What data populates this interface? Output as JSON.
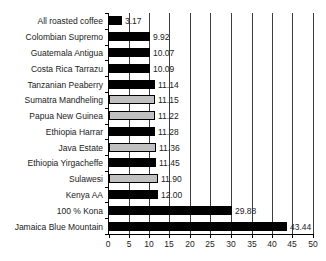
{
  "chart_data": {
    "type": "bar",
    "orientation": "horizontal",
    "title": "",
    "xlabel": "",
    "ylabel": "",
    "legend": "none",
    "grid": "vertical gridlines at each x tick",
    "categories": [
      "All roasted coffee",
      "Colombian Supremo",
      "Guatemala Antigua",
      "Costa Rica Tarrazu",
      "Tanzanian Peaberry",
      "Sumatra Mandheling",
      "Papua New Guinea",
      "Ethiopia Harrar",
      "Java Estate",
      "Ethiopia Yirgacheffe",
      "Sulawesi",
      "Kenya AA",
      "100 % Kona",
      "Jamaica Blue Mountain"
    ],
    "values": [
      3.17,
      9.92,
      10.07,
      10.09,
      11.14,
      11.15,
      11.22,
      11.28,
      11.36,
      11.45,
      11.9,
      12.0,
      29.88,
      43.44
    ],
    "value_labels": [
      "3.17",
      "9.92",
      "10.07",
      "10.09",
      "11.14",
      "11.15",
      "11.22",
      "11.28",
      "11.36",
      "11.45",
      "11.90",
      "12.00",
      "29.88",
      "43.44"
    ],
    "bar_colors": [
      "#000000",
      "#000000",
      "#000000",
      "#000000",
      "#000000",
      "#c0c0c0",
      "#c0c0c0",
      "#000000",
      "#c0c0c0",
      "#000000",
      "#c0c0c0",
      "#000000",
      "#000000",
      "#000000"
    ],
    "xlim": [
      0,
      50
    ],
    "xticks": [
      "0",
      "5",
      "10",
      "15",
      "20",
      "25",
      "30",
      "35",
      "40",
      "45",
      "50"
    ],
    "colors": {
      "bar_outline": "#000000",
      "black_bar_fill": "#000000",
      "gray_bar_fill": "#c0c0c0",
      "grid_line": "#3d3d3d",
      "axis_line": "#000000",
      "background": "#ffffff",
      "label_text": "#222222"
    }
  }
}
